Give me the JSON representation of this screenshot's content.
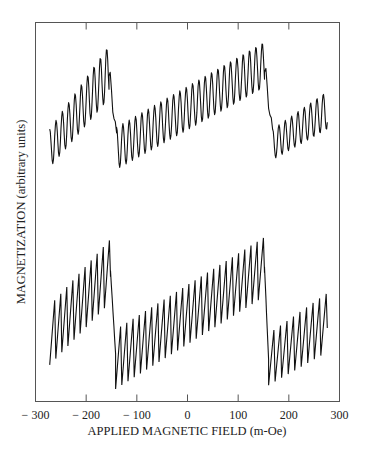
{
  "chart_data": {
    "type": "line",
    "title": "",
    "xlabel": "APPLIED MAGNETIC FIELD (m-Oe)",
    "ylabel": "MAGNETIZATION (arbitrary units)",
    "xlim": [
      -300,
      300
    ],
    "ylim": null,
    "grid": false,
    "legend": null,
    "x_ticks": [
      -300,
      -200,
      -100,
      0,
      100,
      200,
      300
    ],
    "x_tick_labels": [
      "− 300",
      "− 200",
      "− 100",
      "0",
      "100",
      "200",
      "300"
    ],
    "series": [
      {
        "name": "upper trace (smooth oscillations)",
        "style": "sinusoidal",
        "x_range": [
          -272,
          276
        ],
        "period_mOe": 12.5,
        "segments": [
          {
            "x_start": -272,
            "x_end": -155,
            "trend_start": 0.42,
            "trend_end": 0.82,
            "amplitude_start": 0.1,
            "amplitude_end": 0.14
          },
          {
            "x_start": -155,
            "x_end": -140,
            "transition": "drop",
            "from": 0.8,
            "to": 0.5
          },
          {
            "x_start": -140,
            "x_end": 152,
            "trend_start": 0.42,
            "trend_end": 0.86,
            "amplitude_start": 0.11,
            "amplitude_end": 0.12
          },
          {
            "x_start": 152,
            "x_end": 168,
            "transition": "drop",
            "from": 0.82,
            "to": 0.52
          },
          {
            "x_start": 168,
            "x_end": 276,
            "trend_start": 0.44,
            "trend_end": 0.62,
            "amplitude_start": 0.08,
            "amplitude_end": 0.1
          }
        ]
      },
      {
        "name": "lower trace (sawtooth)",
        "style": "sawtooth",
        "x_range": [
          -272,
          276
        ],
        "period_mOe": 12.5,
        "segments": [
          {
            "x_start": -272,
            "x_end": -152,
            "trend_start": 0.35,
            "trend_end": 0.7,
            "amplitude_start": 0.16,
            "amplitude_end": 0.17
          },
          {
            "x_start": -152,
            "x_end": -142,
            "transition": "drop",
            "from": 0.7,
            "to": 0.25
          },
          {
            "x_start": -142,
            "x_end": 152,
            "trend_start": 0.22,
            "trend_end": 0.72,
            "amplitude_start": 0.16,
            "amplitude_end": 0.16
          },
          {
            "x_start": 152,
            "x_end": 160,
            "transition": "drop",
            "from": 0.72,
            "to": 0.22
          },
          {
            "x_start": 160,
            "x_end": 276,
            "trend_start": 0.22,
            "trend_end": 0.42,
            "amplitude_start": 0.14,
            "amplitude_end": 0.16
          }
        ]
      }
    ]
  }
}
